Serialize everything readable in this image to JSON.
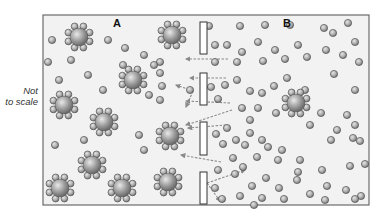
{
  "figure": {
    "type": "osmosis-semipermeable-membrane",
    "note": [
      "Not",
      "to scale"
    ],
    "compartments": [
      {
        "id": "A",
        "label": "A"
      },
      {
        "id": "B",
        "label": "B"
      }
    ],
    "colors": {
      "background": "#f2f2f2",
      "frame": "#6b6b6b",
      "molecule_fill_light": "#d6d6d6",
      "molecule_fill_dark": "#707070",
      "arrow": "#8a8a8a",
      "membrane_fill": "#ffffff"
    },
    "frame": {
      "x": 43,
      "y": 15,
      "w": 326,
      "h": 190
    },
    "membrane_segments": [
      {
        "x": 200,
        "y": 22,
        "w": 7,
        "h": 32
      },
      {
        "x": 200,
        "y": 73,
        "w": 7,
        "h": 32
      },
      {
        "x": 200,
        "y": 122,
        "w": 7,
        "h": 33
      },
      {
        "x": 200,
        "y": 172,
        "w": 7,
        "h": 32
      }
    ],
    "large_molecules": [
      [
        79,
        37
      ],
      [
        172,
        35
      ],
      [
        133,
        80
      ],
      [
        64,
        105
      ],
      [
        104,
        122
      ],
      [
        170,
        136
      ],
      [
        92,
        165
      ],
      [
        60,
        188
      ],
      [
        122,
        188
      ],
      [
        168,
        182
      ],
      [
        296,
        103
      ]
    ],
    "small_molecules": [
      [
        52,
        40
      ],
      [
        48,
        62
      ],
      [
        71,
        60
      ],
      [
        59,
        80
      ],
      [
        88,
        75
      ],
      [
        103,
        90
      ],
      [
        123,
        65
      ],
      [
        144,
        55
      ],
      [
        160,
        62
      ],
      [
        149,
        95
      ],
      [
        160,
        100
      ],
      [
        55,
        145
      ],
      [
        84,
        140
      ],
      [
        144,
        150
      ],
      [
        139,
        135
      ],
      [
        160,
        73
      ],
      [
        162,
        86
      ],
      [
        190,
        90
      ],
      [
        108,
        40
      ],
      [
        125,
        48
      ],
      [
        154,
        65
      ],
      [
        209,
        26
      ],
      [
        215,
        45
      ],
      [
        227,
        45
      ],
      [
        240,
        26
      ],
      [
        242,
        52
      ],
      [
        215,
        62
      ],
      [
        237,
        62
      ],
      [
        265,
        25
      ],
      [
        258,
        42
      ],
      [
        275,
        50
      ],
      [
        263,
        61
      ],
      [
        290,
        25
      ],
      [
        298,
        45
      ],
      [
        285,
        59
      ],
      [
        307,
        57
      ],
      [
        324,
        28
      ],
      [
        333,
        33
      ],
      [
        348,
        23
      ],
      [
        355,
        42
      ],
      [
        326,
        50
      ],
      [
        343,
        55
      ],
      [
        359,
        62
      ],
      [
        211,
        87
      ],
      [
        225,
        85
      ],
      [
        237,
        80
      ],
      [
        250,
        91
      ],
      [
        262,
        93
      ],
      [
        274,
        86
      ],
      [
        287,
        78
      ],
      [
        305,
        90
      ],
      [
        334,
        74
      ],
      [
        355,
        90
      ],
      [
        218,
        99
      ],
      [
        242,
        108
      ],
      [
        258,
        108
      ],
      [
        276,
        113
      ],
      [
        321,
        113
      ],
      [
        347,
        115
      ],
      [
        310,
        125
      ],
      [
        337,
        130
      ],
      [
        355,
        125
      ],
      [
        250,
        120
      ],
      [
        227,
        128
      ],
      [
        250,
        133
      ],
      [
        262,
        140
      ],
      [
        236,
        140
      ],
      [
        245,
        145
      ],
      [
        268,
        147
      ],
      [
        282,
        150
      ],
      [
        300,
        160
      ],
      [
        331,
        140
      ],
      [
        353,
        138
      ],
      [
        360,
        141
      ],
      [
        216,
        134
      ],
      [
        223,
        144
      ],
      [
        233,
        158
      ],
      [
        257,
        157
      ],
      [
        278,
        160
      ],
      [
        298,
        172
      ],
      [
        322,
        170
      ],
      [
        350,
        166
      ],
      [
        365,
        164
      ],
      [
        218,
        170
      ],
      [
        235,
        174
      ],
      [
        252,
        186
      ],
      [
        266,
        178
      ],
      [
        279,
        188
      ],
      [
        297,
        180
      ],
      [
        310,
        194
      ],
      [
        327,
        186
      ],
      [
        346,
        190
      ],
      [
        361,
        196
      ],
      [
        222,
        199
      ],
      [
        240,
        196
      ],
      [
        262,
        198
      ],
      [
        284,
        199
      ],
      [
        325,
        200
      ],
      [
        355,
        199
      ],
      [
        243,
        167
      ],
      [
        215,
        188
      ],
      [
        254,
        205
      ]
    ],
    "arrows": [
      {
        "from": [
          228,
          59
        ],
        "to": [
          186,
          59
        ]
      },
      {
        "from": [
          226,
          78
        ],
        "to": [
          190,
          78
        ]
      },
      {
        "from": [
          193,
          91
        ],
        "to": [
          176,
          85
        ]
      },
      {
        "from": [
          193,
          91
        ],
        "to": [
          186,
          107
        ]
      },
      {
        "from": [
          230,
          103
        ],
        "to": [
          186,
          101
        ]
      },
      {
        "from": [
          232,
          110
        ],
        "to": [
          186,
          125
        ]
      },
      {
        "from": [
          226,
          125
        ],
        "to": [
          188,
          128
        ]
      },
      {
        "from": [
          221,
          162
        ],
        "to": [
          181,
          155
        ]
      },
      {
        "from": [
          207,
          183
        ],
        "to": [
          245,
          170
        ]
      },
      {
        "from": [
          207,
          183
        ],
        "to": [
          220,
          201
        ]
      }
    ]
  }
}
